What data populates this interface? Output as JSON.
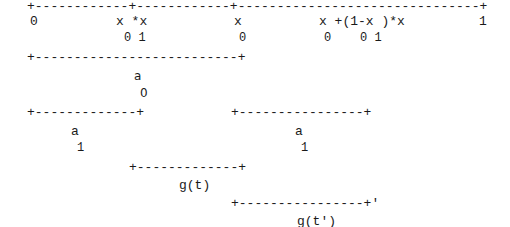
{
  "diagram": {
    "type": "ascii-interval-diagram",
    "rows": [
      {
        "id": "top-axis",
        "text": "+------------+------------+-------------------------------+",
        "x": 27,
        "y": 0
      },
      {
        "id": "axis-label-0",
        "text": "0",
        "x": 30,
        "y": 15
      },
      {
        "id": "x0x1-expr",
        "text": "x *x",
        "x": 116,
        "y": 15
      },
      {
        "id": "x0x1-subs",
        "text": "0 1",
        "x": 124,
        "y": 32
      },
      {
        "id": "x0-expr",
        "text": "x",
        "x": 234,
        "y": 15
      },
      {
        "id": "x0-sub",
        "text": "0",
        "x": 239,
        "y": 32
      },
      {
        "id": "interp-expr",
        "text": "x +(1-x )*x",
        "x": 319,
        "y": 15
      },
      {
        "id": "interp-subs",
        "text": "0    0 1",
        "x": 324,
        "y": 32
      },
      {
        "id": "axis-label-1",
        "text": "1",
        "x": 479,
        "y": 15
      },
      {
        "id": "a0-interval",
        "text": "+--------------------------+",
        "x": 27,
        "y": 51
      },
      {
        "id": "a0-label",
        "text": "a",
        "x": 134,
        "y": 70
      },
      {
        "id": "a0-sub",
        "text": "0",
        "x": 140,
        "y": 87
      },
      {
        "id": "a1-left-interval",
        "text": "+-------------+",
        "x": 27,
        "y": 106
      },
      {
        "id": "a1-right-interval",
        "text": "+----------------+",
        "x": 231,
        "y": 106
      },
      {
        "id": "a1-left-label",
        "text": "a",
        "x": 71,
        "y": 125
      },
      {
        "id": "a1-left-sub",
        "text": "1",
        "x": 77,
        "y": 142
      },
      {
        "id": "a1-right-label",
        "text": "a",
        "x": 295,
        "y": 125
      },
      {
        "id": "a1-right-sub",
        "text": "1",
        "x": 301,
        "y": 142
      },
      {
        "id": "gt-interval",
        "text": "+-------------+",
        "x": 129,
        "y": 161
      },
      {
        "id": "gt-label",
        "text": "g(t)",
        "x": 179,
        "y": 179
      },
      {
        "id": "gtp-interval",
        "text": "+----------------+'",
        "x": 231,
        "y": 197
      },
      {
        "id": "gtp-label",
        "text": "g(t')",
        "x": 297,
        "y": 215
      }
    ]
  }
}
